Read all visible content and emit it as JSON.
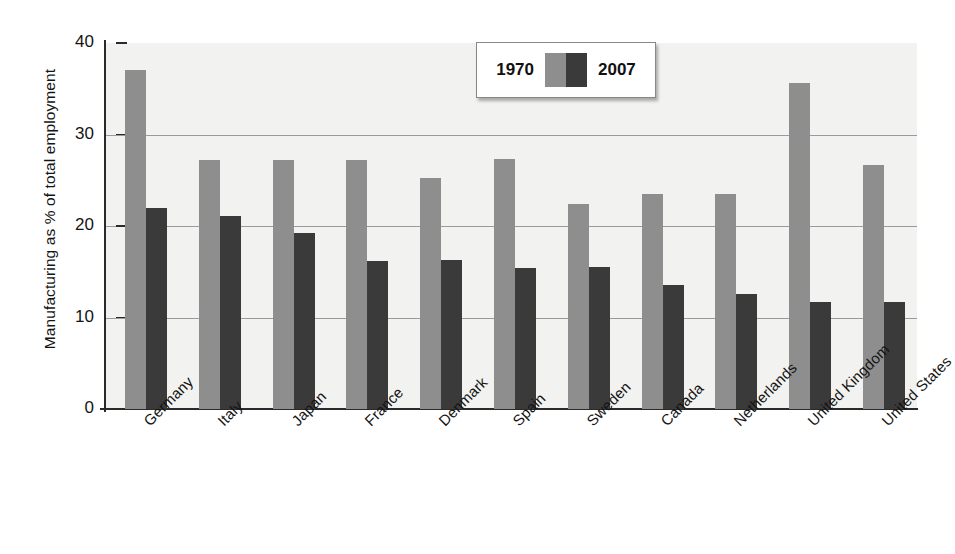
{
  "chart_data": {
    "type": "bar",
    "title": "",
    "xlabel": "",
    "ylabel": "Manufacturing as % of total employment",
    "ylim": [
      0,
      40
    ],
    "yticks": [
      0,
      10,
      20,
      30,
      40
    ],
    "ytick_labels": [
      "0",
      "10",
      "20",
      "30",
      "40"
    ],
    "grid": "horizontal gridlines at 10, 20, 30",
    "legend_position": "top-center-right inside plot",
    "categories": [
      "Germany",
      "Italy",
      "Japan",
      "France",
      "Denmark",
      "Spain",
      "Sweden",
      "Canada",
      "Netherlands",
      "United Kingdom",
      "United States"
    ],
    "series": [
      {
        "name": "1970",
        "color": "#8e8e8e",
        "values": [
          37.1,
          27.2,
          27.2,
          27.2,
          25.3,
          27.3,
          22.4,
          23.5,
          23.5,
          35.6,
          26.7
        ]
      },
      {
        "name": "2007",
        "color": "#3a3a3a",
        "values": [
          22.0,
          21.1,
          19.2,
          16.2,
          16.3,
          15.4,
          15.5,
          13.5,
          12.6,
          11.7,
          11.7
        ]
      }
    ]
  },
  "legend": {
    "left_label": "1970",
    "right_label": "2007"
  },
  "colors": {
    "series_1970": "#8e8e8e",
    "series_2007": "#3a3a3a",
    "plot_background": "#f2f2f0",
    "axis": "#2a2a2a",
    "gridline": "#9a9a9a"
  }
}
